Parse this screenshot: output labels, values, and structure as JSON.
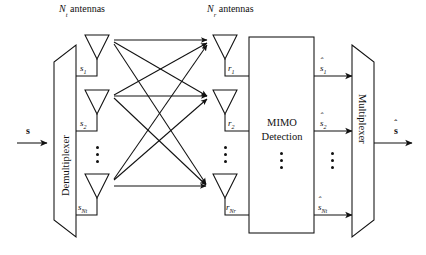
{
  "figure": {
    "stroke_color": "#111111",
    "background": "#ffffff"
  },
  "headers": {
    "transmit": {
      "symbol": "N",
      "subscript": "t",
      "text": "antennas",
      "full": "Nt antennas"
    },
    "receive": {
      "symbol": "N",
      "subscript": "r",
      "text": "antennas",
      "full": "Nr antennas"
    }
  },
  "input": {
    "label": "s",
    "hat": false,
    "name": "input signal vector"
  },
  "output": {
    "label": "s",
    "hat": true,
    "name": "estimated signal vector"
  },
  "blocks": {
    "demultiplexer": {
      "label": "Demultiplexer",
      "orientation": "vertical-ccw"
    },
    "detection": {
      "line1": "MIMO",
      "line2": "Detection"
    },
    "multiplexer": {
      "label": "Multiplexer",
      "orientation": "vertical-cw"
    }
  },
  "transmit_signals": [
    {
      "symbol": "s",
      "subscript": "1"
    },
    {
      "symbol": "s",
      "subscript": "2"
    },
    {
      "symbol": "s",
      "subscript": "Nt"
    }
  ],
  "receive_signals": [
    {
      "symbol": "r",
      "subscript": "1"
    },
    {
      "symbol": "r",
      "subscript": "2"
    },
    {
      "symbol": "r",
      "subscript": "Nr"
    }
  ],
  "estimated_signals": [
    {
      "symbol": "s",
      "subscript": "1",
      "hat": true
    },
    {
      "symbol": "s",
      "subscript": "2",
      "hat": true
    },
    {
      "symbol": "s",
      "subscript": "Nt",
      "hat": true
    }
  ],
  "ellipsis": {
    "glyph": "⋮",
    "count": 3
  },
  "channel": {
    "description": "fully connected MIMO channel paths",
    "tx_count": 3,
    "rx_count": 3,
    "path_count": 9
  }
}
